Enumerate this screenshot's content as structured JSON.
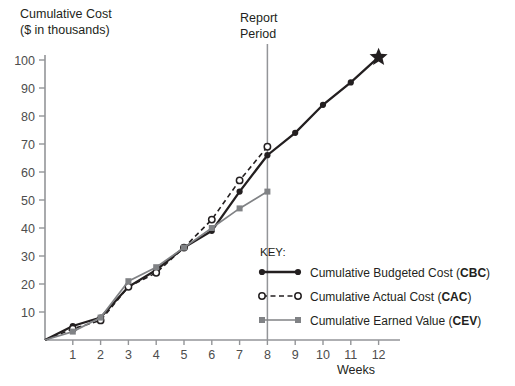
{
  "chart_data": {
    "type": "line",
    "title": "",
    "ylabel": "Cumulative Cost\n($ in thousands)",
    "ylabel_line1": "Cumulative Cost",
    "ylabel_line2": "($ in thousands)",
    "xlabel": "Weeks",
    "x": [
      1,
      2,
      3,
      4,
      5,
      6,
      7,
      8,
      9,
      10,
      11,
      12
    ],
    "xlim": [
      0,
      12
    ],
    "ylim": [
      0,
      100
    ],
    "yticks": [
      10,
      20,
      30,
      40,
      50,
      60,
      70,
      80,
      90,
      100
    ],
    "xticks": [
      1,
      2,
      3,
      4,
      5,
      6,
      7,
      8,
      9,
      10,
      11,
      12
    ],
    "grid": false,
    "legend_position": "inside-lower-right",
    "series": [
      {
        "name": "Cumulative Budgeted Cost (CBC)",
        "code": "CBC",
        "label_text": "Cumulative Budgeted Cost (",
        "label_suffix": ")",
        "style": "solid",
        "color": "#231f20",
        "marker": "filled-circle",
        "x": [
          1,
          2,
          3,
          4,
          5,
          6,
          7,
          8,
          9,
          10,
          11,
          12
        ],
        "values": [
          5,
          8,
          19,
          25,
          33,
          39,
          53,
          66,
          74,
          84,
          92,
          101
        ],
        "end_marker": "star"
      },
      {
        "name": "Cumulative Actual Cost (CAC)",
        "code": "CAC",
        "label_text": "Cumulative Actual Cost (",
        "label_suffix": ")",
        "style": "dashed",
        "color": "#231f20",
        "marker": "open-circle",
        "x": [
          1,
          2,
          3,
          4,
          5,
          6,
          7,
          8
        ],
        "values": [
          4,
          7,
          19,
          24,
          33,
          43,
          57,
          69
        ]
      },
      {
        "name": "Cumulative Earned Value (CEV)",
        "code": "CEV",
        "label_text": "Cumulative Earned Value (",
        "label_suffix": ")",
        "style": "solid",
        "color": "#808285",
        "marker": "filled-square",
        "x": [
          1,
          2,
          3,
          4,
          5,
          6,
          7,
          8
        ],
        "values": [
          3,
          8,
          21,
          26,
          33,
          40,
          47,
          53
        ]
      }
    ],
    "annotations": [
      {
        "name": "report-period",
        "line1": "Report",
        "line2": "Period",
        "at_x": 8,
        "type": "vertical-line",
        "color": "#939598"
      }
    ],
    "legend": {
      "title": "KEY:"
    },
    "colors": {
      "axis": "#939598",
      "primary": "#231f20",
      "secondary": "#808285",
      "report_line": "#939598"
    }
  }
}
